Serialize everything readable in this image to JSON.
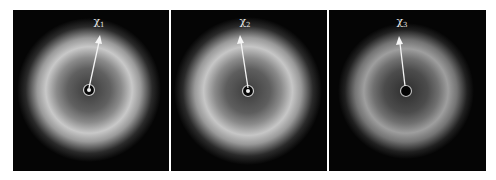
{
  "figure": {
    "panels": [
      {
        "id": "p1",
        "symbol": "χ",
        "subscript": "1",
        "beamstop_center_bright": true,
        "ring_color": "#d8d8d8"
      },
      {
        "id": "p2",
        "symbol": "χ",
        "subscript": "2",
        "beamstop_center_bright": true,
        "ring_color": "#d6d6d6"
      },
      {
        "id": "p3",
        "symbol": "χ",
        "subscript": "3",
        "beamstop_center_bright": false,
        "ring_color": "#a8a8a8"
      }
    ],
    "colors": {
      "background": "#050505",
      "arrow": "#f4f4f4"
    }
  }
}
